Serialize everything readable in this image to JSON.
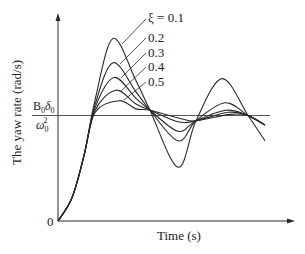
{
  "chart_data": {
    "type": "line",
    "title": "",
    "xlabel": "Time (s)",
    "ylabel": "The yaw rate (rad/s)",
    "y_ticks": [
      {
        "label": "0",
        "value": 0
      },
      {
        "label": "B0δ0/ω0²",
        "value": 1
      }
    ],
    "steady_state_label": {
      "numerator": "B",
      "num_sub": "0",
      "num_sym": "δ",
      "num_sym_sub": "0",
      "denominator": "ω",
      "den_sub": "0",
      "den_sup": "2"
    },
    "grid": false,
    "legend_position": "inline-annotations-top-right",
    "parameter": "ξ",
    "series": [
      {
        "name": "ξ = 0.1",
        "label": "ξ = 0.1",
        "zeta": 0.1,
        "peak": 1.73,
        "trough": 0.51,
        "second_peak": 1.35
      },
      {
        "name": "ξ = 0.2",
        "label": "0.2",
        "zeta": 0.2,
        "peak": 1.5,
        "trough": 0.76,
        "second_peak": 1.12
      },
      {
        "name": "ξ = 0.3",
        "label": "0.3",
        "zeta": 0.3,
        "peak": 1.36,
        "trough": 0.85,
        "second_peak": 1.05
      },
      {
        "name": "ξ = 0.4",
        "label": "0.4",
        "zeta": 0.4,
        "peak": 1.24,
        "trough": 0.94,
        "second_peak": 1.03
      },
      {
        "name": "ξ = 0.5",
        "label": "0.5",
        "zeta": 0.5,
        "peak": 1.14,
        "trough": 0.97,
        "second_peak": 1.01
      }
    ],
    "x_range": [
      0,
      1
    ],
    "ylim": [
      0,
      2
    ]
  },
  "labels": {
    "xlabel": "Time (s)",
    "ylabel": "The yaw rate (rad/s)",
    "zero": "0",
    "xi_prefix": "ξ = ",
    "series_labels": [
      "ξ = 0.1",
      "0.2",
      "0.3",
      "0.4",
      "0.5"
    ]
  }
}
